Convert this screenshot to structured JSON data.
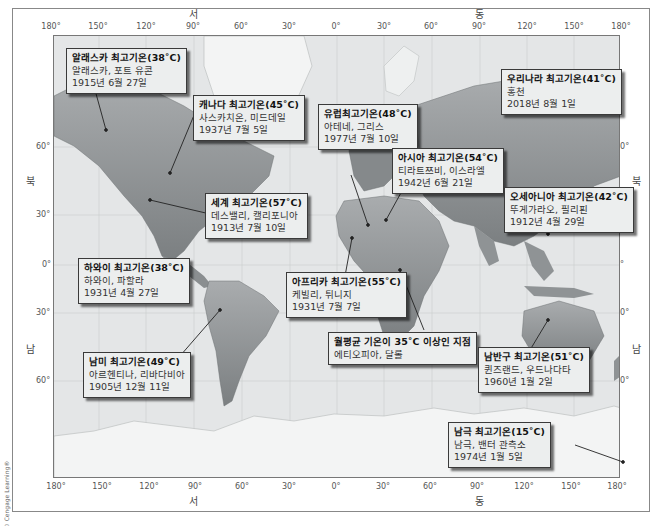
{
  "figure": {
    "credit": "© Cengage Learning®"
  },
  "axes": {
    "direction": {
      "west": "서",
      "east": "동",
      "north": "북",
      "south": "남"
    },
    "longitude_ticks": [
      "180°",
      "150°",
      "120°",
      "90°",
      "60°",
      "30°",
      "0°",
      "30°",
      "60°",
      "90°",
      "120°",
      "150°",
      "180°"
    ],
    "latitude_ticks": [
      "60°",
      "30°",
      "0°",
      "30°",
      "60°"
    ]
  },
  "callouts": [
    {
      "id": "alaska",
      "title": "알래스카 최고기온(38˚C)",
      "place": "알래스카, 포트 유콘",
      "date": "1915년 6월 27일"
    },
    {
      "id": "canada",
      "title": "캐나다 최고기온(45˚C)",
      "place": "사스카치온, 미드데일",
      "date": "1937년 7월 5일"
    },
    {
      "id": "europe",
      "title": "유럽최고기온(48˚C)",
      "place": "아테네, 그리스",
      "date": "1977년 7월 10일"
    },
    {
      "id": "korea",
      "title": "우리나라 최고기온(41˚C)",
      "place": "홍천",
      "date": "2018년 8월 1일"
    },
    {
      "id": "asia",
      "title": "아시아 최고기온(54˚C)",
      "place": "티라트쯔비, 이스라엘",
      "date": "1942년 6월 21일"
    },
    {
      "id": "world",
      "title": "세계 최고기온(57˚C)",
      "place": "데스밸리, 캘리포니아",
      "date": "1913년 7월 10일"
    },
    {
      "id": "oceania",
      "title": "오세아니아 최고기온(42˚C)",
      "place": "뚜게가라오, 필리핀",
      "date": "1912년 4월 29일"
    },
    {
      "id": "hawaii",
      "title": "하와이 최고기온(38˚C)",
      "place": "하와이, 파할라",
      "date": "1931년 4월 27일"
    },
    {
      "id": "africa",
      "title": "아프리카 최고기온(55˚C)",
      "place": "케빌리, 튀니지",
      "date": "1931년 7월 7일"
    },
    {
      "id": "annual",
      "title": "월평균 기온이 35˚C 이상인 지점",
      "place": "에티오피아, 달롤",
      "date": ""
    },
    {
      "id": "south_hemisphere",
      "title": "남반구 최고기온(51˚C)",
      "place": "퀸즈랜드, 우드나다타",
      "date": "1960년 1월 2일"
    },
    {
      "id": "south_america",
      "title": "남미 최고기온(49˚C)",
      "place": "아르헨티나, 리바다비아",
      "date": "1905년 12월 11일"
    },
    {
      "id": "antarctica",
      "title": "남극 최고기온(15˚C)",
      "place": "남극, 밴터 관측소",
      "date": "1974년 1월 5일"
    }
  ],
  "colors": {
    "callout_bg": "#eceeee",
    "callout_border": "#3a3a3a",
    "land_dark": "#6f7375",
    "land_mid": "#9a9d9f",
    "ice": "#f4f5f5",
    "ocean": "#e4e6e7"
  }
}
